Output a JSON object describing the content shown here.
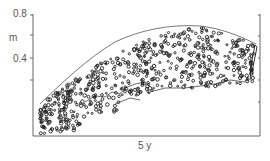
{
  "figure": {
    "y_axis": {
      "unit_label": "m",
      "ticks": [
        "0.8",
        "0.4"
      ]
    },
    "x_axis": {
      "label": "5 y"
    }
  }
}
